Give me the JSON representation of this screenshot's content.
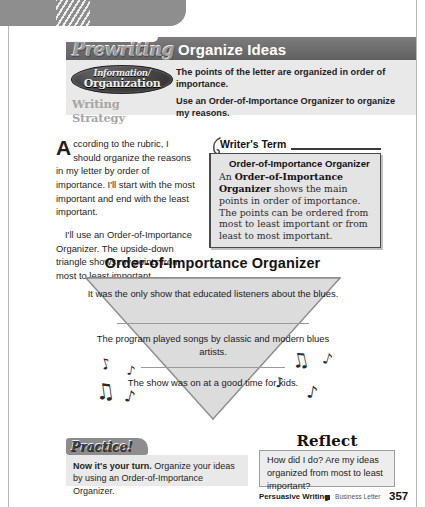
{
  "page": {
    "top_band_icon": "hatch-pattern"
  },
  "banner": {
    "stage_label": "Prewriting",
    "title": "Organize Ideas"
  },
  "strategy": {
    "badge_line_1": "Information/",
    "badge_line_2": "Organization",
    "badge_text": "Information/Organization",
    "point_text": "The points of the letter are organized in order of importance.",
    "strategy_label": "Writing Strategy",
    "strategy_text": "Use an Order-of-Importance Organizer to organize my reasons."
  },
  "body": {
    "dropcap": "A",
    "paragraph_1": "ccording to the rubric, I should organize the reasons in my letter by order of importance. I'll start with the most important and end with the least important.",
    "paragraph_2": "I'll use an Order-of-Importance Organizer. The upside-down triangle shows my points from most to least important."
  },
  "writers_term": {
    "heading": "Writer's Term",
    "term": "Order-of-Importance Organizer",
    "definition_prefix": "An ",
    "definition_term": "Order-of-Importance Organizer",
    "definition_rest": " shows the main points in order of importance. The points can be ordered from most to least important or from least to most important."
  },
  "organizer": {
    "title": "Order-of-Importance Organizer",
    "rows": [
      "It was the only show that educated listeners about the blues.",
      "The program played songs by classic and modern blues artists.",
      "The show was on at a good time for kids."
    ],
    "decoration": "music-notes"
  },
  "practice": {
    "tab_label": "Practice!",
    "lead": "Now it's your turn.",
    "rest": " Organize your ideas by using an Order-of-Importance Organizer."
  },
  "reflect": {
    "title": "Reflect",
    "text": "How did I do? Are my ideas organized from most to least important?"
  },
  "footer": {
    "strand": "Persuasive Writing",
    "genre": "Business Letter",
    "page_number": "357"
  },
  "colors": {
    "band_gray": "#8e8e8e",
    "banner_gray": "#6d6d6d",
    "panel_gray": "#e9e9e9",
    "triangle_fill": "#dcdcdc",
    "ink": "#1a1a1a"
  }
}
